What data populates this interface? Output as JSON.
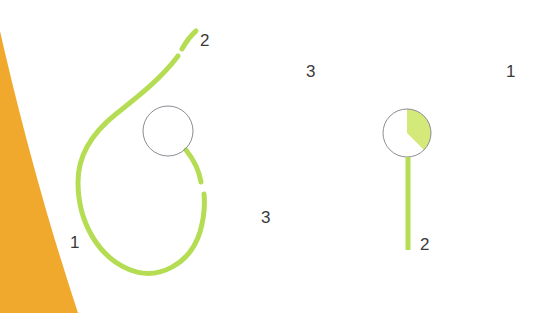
{
  "figure": {
    "title": "",
    "width": 549,
    "height": 313,
    "background_color": "#ffffff"
  },
  "colors": {
    "green_stroke": "#b5dd54",
    "green_wedge_fill": "#d3e97a",
    "orange_fill": "#f0a92c",
    "circle_outline": "#8c8c94",
    "label_text": "#3a3a3a"
  },
  "labels": [
    {
      "id": "label-2-top-left",
      "text": "2",
      "x": 200,
      "y": 40
    },
    {
      "id": "label-1-left",
      "text": "1",
      "x": 73,
      "y": 242
    },
    {
      "id": "label-3-mid",
      "text": "3",
      "x": 265,
      "y": 218
    },
    {
      "id": "label-3-upper",
      "text": "3",
      "x": 310,
      "y": 72
    },
    {
      "id": "label-1-right",
      "text": "1",
      "x": 509,
      "y": 72
    },
    {
      "id": "label-2-right",
      "text": "2",
      "x": 424,
      "y": 244
    }
  ],
  "shapes": {
    "orange_wedge": {
      "name": "orange-wedge-shape",
      "path": "M 0,31 C 18,110 44,210 78,313 L 0,313 Z",
      "fill": "#f0a92c"
    },
    "left_circle": {
      "name": "left-circle",
      "cx": 168,
      "cy": 131,
      "r": 25,
      "fill": "none",
      "stroke": "#8c8c94",
      "stroke_width": 1
    },
    "right_circle": {
      "name": "right-circle",
      "cx": 407,
      "cy": 133,
      "r": 24,
      "fill": "none",
      "stroke": "#8c8c94",
      "stroke_width": 1
    },
    "right_circle_wedge": {
      "name": "right-circle-pie-wedge",
      "path": "M 407,133 L 407,109 A 24,24 0 0 1 424,150 Z",
      "fill": "#d3e97a",
      "start_angle_deg": 0,
      "sweep_angle_deg": 135
    },
    "green_curve_upper": {
      "name": "green-curve-upper-segment",
      "path": "M 196,31 C 190,36 186,42 182,49",
      "stroke": "#b5dd54",
      "stroke_width": 5
    },
    "green_curve_main": {
      "name": "green-curve-main-segment",
      "path": "M 178,56 C 160,80 136,98 116,114 C 92,133 78,156 78,182 C 78,222 98,256 128,269 C 158,282 190,264 200,232 C 204,218 205,204 204,194",
      "stroke": "#b5dd54",
      "stroke_width": 5
    },
    "green_curve_circle_tail": {
      "name": "green-curve-circle-tail-segment",
      "path": "M 186,150 C 194,160 199,170 201,182",
      "stroke": "#b5dd54",
      "stroke_width": 5
    },
    "green_stem": {
      "name": "green-stem-line",
      "path": "M 408,157 L 408,250",
      "stroke": "#b5dd54",
      "stroke_width": 5
    }
  }
}
